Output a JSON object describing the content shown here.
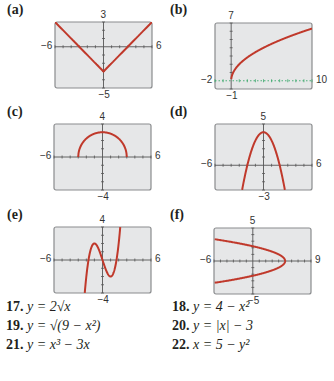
{
  "colors": {
    "curve": "#c0392b",
    "screen_bg": "#e6e7e8",
    "frame": "#8a8c8e",
    "axis": "#555555",
    "dotted_axis": "#3aa86b"
  },
  "chart_data": [
    {
      "label": "(a)",
      "type": "line",
      "xlim": [
        -6,
        6
      ],
      "ylim": [
        -5,
        3
      ],
      "x_min_label": "−6",
      "x_max_label": "6",
      "y_max_label": "3",
      "y_min_label": "−5",
      "description": "V-shape, vertex at (0,-3)",
      "x": [
        -6,
        0,
        6
      ],
      "y": [
        3,
        -3,
        3
      ]
    },
    {
      "label": "(b)",
      "type": "line",
      "xlim": [
        -2,
        10
      ],
      "ylim": [
        -1,
        7
      ],
      "x_min_label": "−2",
      "x_max_label": "10",
      "y_max_label": "7",
      "y_min_label": "−1",
      "description": "square-root curve starting at origin",
      "x": [
        0,
        1,
        4,
        9,
        10
      ],
      "y": [
        0,
        2,
        4,
        6,
        6.32
      ]
    },
    {
      "label": "(c)",
      "type": "line",
      "xlim": [
        -6,
        6
      ],
      "ylim": [
        -4,
        4
      ],
      "x_min_label": "−6",
      "x_max_label": "6",
      "y_max_label": "4",
      "y_min_label": "−4",
      "description": "upper semicircle radius 3",
      "x": [
        -3,
        -2,
        0,
        2,
        3
      ],
      "y": [
        0,
        2.24,
        3,
        2.24,
        0
      ]
    },
    {
      "label": "(d)",
      "type": "line",
      "xlim": [
        -6,
        6
      ],
      "ylim": [
        -3,
        5
      ],
      "x_min_label": "−6",
      "x_max_label": "6",
      "y_max_label": "5",
      "y_min_label": "−3",
      "description": "downward parabola vertex (0,4)",
      "x": [
        -2.65,
        -2,
        0,
        2,
        2.65
      ],
      "y": [
        -3,
        0,
        4,
        0,
        -3
      ]
    },
    {
      "label": "(e)",
      "type": "line",
      "xlim": [
        -6,
        6
      ],
      "ylim": [
        -4,
        4
      ],
      "x_min_label": "−6",
      "x_max_label": "6",
      "y_max_label": "4",
      "y_min_label": "−4",
      "description": "cubic with local max (-1,2) and min (1,-2)",
      "x": [
        -2.2,
        -1.73,
        -1,
        0,
        1,
        1.73,
        2.2
      ],
      "y": [
        -4,
        0,
        2,
        0,
        -2,
        0,
        4
      ]
    },
    {
      "label": "(f)",
      "type": "line",
      "xlim": [
        -6,
        9
      ],
      "ylim": [
        -5,
        5
      ],
      "x_min_label": "−6",
      "x_max_label": "9",
      "y_max_label": "5",
      "y_min_label": "−5",
      "description": "leftward parabola vertex (5,0)",
      "x": [
        -6,
        1,
        5,
        1,
        -6
      ],
      "y": [
        3.3,
        2,
        0,
        -2,
        -3.3
      ]
    }
  ],
  "exercises": [
    {
      "num": "17.",
      "eq": "y = 2√x"
    },
    {
      "num": "18.",
      "eq": "y = 4 − x²"
    },
    {
      "num": "19.",
      "eq": "y = √(9 − x²)"
    },
    {
      "num": "20.",
      "eq": "y = |x| − 3"
    },
    {
      "num": "21.",
      "eq": "y = x³ − 3x"
    },
    {
      "num": "22.",
      "eq": "x = 5 − y²"
    }
  ]
}
